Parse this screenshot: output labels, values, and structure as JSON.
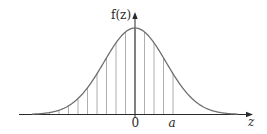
{
  "figure": {
    "y_axis_label": "f(z)",
    "x_axis_label": "z",
    "tick_labels": [
      "0",
      "a"
    ],
    "colors": {
      "curve": "#6e6e6e",
      "axes": "#2a2a2a",
      "strips": "#9a9a9a",
      "text": "#2a2a2a"
    }
  },
  "chart_data": {
    "type": "area",
    "title": "",
    "xlabel": "z",
    "ylabel": "f(z)",
    "function": "standard normal density",
    "x_ticks": [
      {
        "value": 0,
        "label": "0"
      },
      {
        "value": 1.2,
        "label": "a"
      }
    ],
    "shaded_region": {
      "from": "-inf",
      "to": "a",
      "style": "vertical hatch lines"
    },
    "grid": false,
    "legend": null
  }
}
